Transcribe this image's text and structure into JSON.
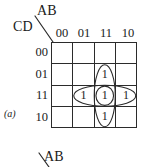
{
  "figure": {
    "caption": "(a)",
    "type": "karnaugh-map",
    "variables_top": "AB",
    "variables_left": "CD"
  },
  "kmap": {
    "top_label": "AB",
    "left_label": "CD",
    "column_headers": [
      "00",
      "01",
      "11",
      "10"
    ],
    "row_headers": [
      "00",
      "01",
      "11",
      "10"
    ],
    "cells": [
      [
        "",
        "",
        "",
        ""
      ],
      [
        "",
        "",
        "1",
        ""
      ],
      [
        "",
        "1",
        "1",
        "1"
      ],
      [
        "",
        "",
        "1",
        ""
      ]
    ],
    "groups": [
      {
        "name": "vertical-oval",
        "shape": "ellipse",
        "cells": [
          [
            1,
            2
          ],
          [
            2,
            2
          ],
          [
            3,
            2
          ]
        ],
        "orientation": "vertical"
      },
      {
        "name": "horizontal-oval",
        "shape": "ellipse",
        "cells": [
          [
            2,
            1
          ],
          [
            2,
            2
          ],
          [
            2,
            3
          ]
        ],
        "orientation": "horizontal"
      },
      {
        "name": "center-circle",
        "shape": "circle",
        "cells": [
          [
            2,
            2
          ]
        ],
        "orientation": "single"
      }
    ]
  },
  "next_figure": {
    "top_label": "AB"
  },
  "colors": {
    "ink": "#1a1a1a",
    "grid_line": "#2b2b2b",
    "oval_line": "#2b2b2b",
    "background": "#ffffff"
  }
}
